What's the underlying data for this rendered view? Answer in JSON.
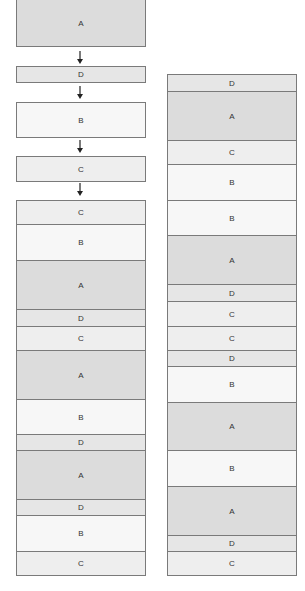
{
  "colors": {
    "A": "#dcdcdc",
    "B": "#f7f7f7",
    "C": "#eeeeee",
    "D": "#e6e6e6",
    "border": "#7a7a7a",
    "text": "#333333"
  },
  "left_sequence": {
    "blocks": [
      {
        "label": "A"
      },
      {
        "label": "D"
      },
      {
        "label": "B"
      },
      {
        "label": "C"
      }
    ],
    "arrows": [
      "down-arrow",
      "down-arrow",
      "down-arrow",
      "down-arrow"
    ]
  },
  "left_stack": {
    "blocks": [
      {
        "label": "C"
      },
      {
        "label": "B"
      },
      {
        "label": "A"
      },
      {
        "label": "D"
      },
      {
        "label": "C"
      },
      {
        "label": "A"
      },
      {
        "label": "B"
      },
      {
        "label": "D"
      },
      {
        "label": "A"
      },
      {
        "label": "D"
      },
      {
        "label": "B"
      },
      {
        "label": "C"
      }
    ]
  },
  "right_stack": {
    "blocks": [
      {
        "label": "D"
      },
      {
        "label": "A"
      },
      {
        "label": "C"
      },
      {
        "label": "B"
      },
      {
        "label": "B"
      },
      {
        "label": "A"
      },
      {
        "label": "D"
      },
      {
        "label": "C"
      },
      {
        "label": "C"
      },
      {
        "label": "D"
      },
      {
        "label": "B"
      },
      {
        "label": "A"
      },
      {
        "label": "B"
      },
      {
        "label": "A"
      },
      {
        "label": "D"
      },
      {
        "label": "C"
      }
    ]
  }
}
